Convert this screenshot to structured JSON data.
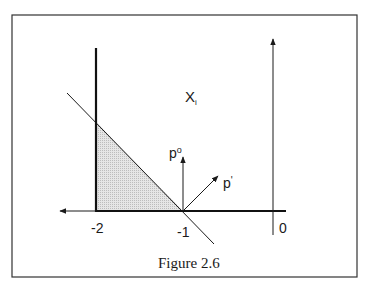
{
  "figure": {
    "caption": "Figure 2.6",
    "region_label": "X",
    "region_label_sub": "i",
    "vectors": {
      "p_zero": {
        "label": "p",
        "sup": "o"
      },
      "p_prime": {
        "label": "p",
        "sup": "'"
      }
    },
    "tick_labels": {
      "minus_two": "-2",
      "minus_one": "-1",
      "zero": "0"
    },
    "colors": {
      "ink": "#1a1a1a",
      "shade": "#d8d8d8",
      "frame": "#333333",
      "background": "#ffffff"
    }
  }
}
